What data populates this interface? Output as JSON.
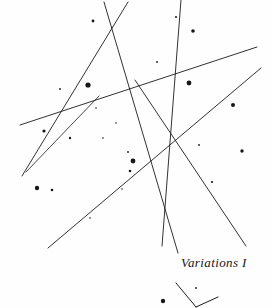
{
  "page": {
    "title": "Variations I",
    "width": 272,
    "height": 308,
    "background_color": "#fefefe",
    "ink_color": "#1b1b1f",
    "medium": "pen-and-ink line drawing"
  },
  "caption": {
    "text": "Variations I",
    "style": "italic serif",
    "color": "#16161a"
  },
  "chart_data": {
    "type": "scatter",
    "title": "Variations I",
    "xlabel": "",
    "ylabel": "",
    "grid": false,
    "legend": "none",
    "xlim": [
      0,
      272
    ],
    "ylim": [
      0,
      308
    ],
    "lines": [
      {
        "name": "line-a-down-right",
        "x1": 104,
        "y1": 2,
        "x2": 178,
        "y2": 253,
        "width": 0.9
      },
      {
        "name": "line-b-down-left",
        "x1": 128,
        "y1": 2,
        "x2": 22,
        "y2": 176,
        "width": 0.9
      },
      {
        "name": "line-c-near-vertical",
        "x1": 181,
        "y1": 0,
        "x2": 162,
        "y2": 246,
        "width": 0.9
      },
      {
        "name": "line-d-shallow-rise",
        "x1": 20,
        "y1": 125,
        "x2": 257,
        "y2": 47,
        "width": 0.9
      },
      {
        "name": "line-e-long-rise",
        "x1": 48,
        "y1": 248,
        "x2": 261,
        "y2": 68,
        "width": 0.9
      },
      {
        "name": "line-f-descend-right",
        "x1": 135,
        "y1": 80,
        "x2": 246,
        "y2": 246,
        "width": 0.9
      },
      {
        "name": "line-g-lower-left-rise",
        "x1": 26,
        "y1": 172,
        "x2": 99,
        "y2": 96,
        "width": 0.8
      }
    ],
    "fragment_lines": [
      {
        "name": "fragment-left-stroke",
        "x1": 176,
        "y1": 283,
        "x2": 196,
        "y2": 307
      },
      {
        "name": "fragment-right-stroke",
        "x1": 196,
        "y1": 307,
        "x2": 218,
        "y2": 297
      }
    ],
    "dots": [
      {
        "x": 93,
        "y": 21,
        "r": 1.4
      },
      {
        "x": 193,
        "y": 31,
        "r": 1.8
      },
      {
        "x": 176,
        "y": 17,
        "r": 1.0
      },
      {
        "x": 88,
        "y": 85,
        "r": 2.6
      },
      {
        "x": 189,
        "y": 83,
        "r": 2.4
      },
      {
        "x": 157,
        "y": 62,
        "r": 0.9
      },
      {
        "x": 233,
        "y": 105,
        "r": 2.0
      },
      {
        "x": 60,
        "y": 89,
        "r": 0.9
      },
      {
        "x": 44,
        "y": 131,
        "r": 1.6
      },
      {
        "x": 70,
        "y": 138,
        "r": 1.2
      },
      {
        "x": 96,
        "y": 108,
        "r": 0.8
      },
      {
        "x": 116,
        "y": 123,
        "r": 0.8
      },
      {
        "x": 128,
        "y": 152,
        "r": 0.9
      },
      {
        "x": 133,
        "y": 161,
        "r": 2.4
      },
      {
        "x": 130,
        "y": 171,
        "r": 1.3
      },
      {
        "x": 242,
        "y": 151,
        "r": 1.7
      },
      {
        "x": 199,
        "y": 145,
        "r": 0.9
      },
      {
        "x": 212,
        "y": 182,
        "r": 1.1
      },
      {
        "x": 37,
        "y": 188,
        "r": 2.2
      },
      {
        "x": 52,
        "y": 190,
        "r": 1.3
      },
      {
        "x": 122,
        "y": 189,
        "r": 0.8
      },
      {
        "x": 103,
        "y": 138,
        "r": 0.8
      },
      {
        "x": 90,
        "y": 218,
        "r": 0.8
      },
      {
        "x": 163,
        "y": 301,
        "r": 2.2
      },
      {
        "x": 196,
        "y": 288,
        "r": 0.9
      }
    ]
  }
}
